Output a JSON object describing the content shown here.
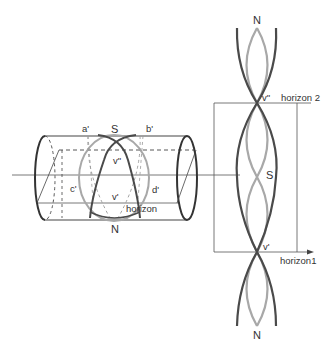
{
  "diagram": {
    "type": "sky-projection-cylinder",
    "colors": {
      "background": "#ffffff",
      "line": "#444444",
      "thin_line": "#555555",
      "dark_curve": "#4a4a4a",
      "light_curve": "#a8a8a8",
      "text": "#333333"
    },
    "cylinder": {
      "labels": {
        "a": "a'",
        "b": "b'",
        "c": "c'",
        "d": "d'",
        "south": "S",
        "north": "N",
        "v_upper": "v\"",
        "v_lower": "v'",
        "horizon": "horizon"
      }
    },
    "unrolled": {
      "labels": {
        "north_top": "N",
        "north_bottom": "N",
        "south": "S",
        "v_upper": "v\"",
        "v_lower": "v'",
        "horizon_2": "horizon 2",
        "horizon_1": "horizon1"
      }
    }
  }
}
